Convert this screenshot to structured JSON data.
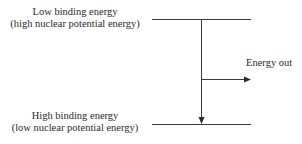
{
  "diagram": {
    "top_level": {
      "line1": "Low binding energy",
      "line2": "(high nuclear potential energy)"
    },
    "bottom_level": {
      "line1": "High binding energy",
      "line2": "(low nuclear potential energy)"
    },
    "energy_out_label": "Energy out",
    "colors": {
      "line": "#3a3a3a",
      "text": "#2a2a2a",
      "background": "#ffffff"
    }
  }
}
